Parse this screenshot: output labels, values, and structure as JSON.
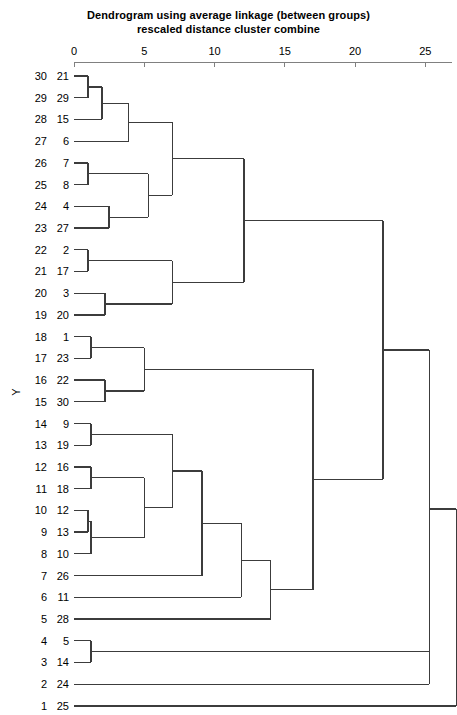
{
  "chart_data": {
    "type": "dendrogram",
    "title": "Dendrogram using average linkage (between groups)",
    "subtitle": "rescaled distance cluster combine",
    "xlabel": "",
    "ylabel": "Y",
    "xlim": [
      0,
      26.5
    ],
    "xticks": [
      0,
      5,
      10,
      15,
      20,
      25
    ],
    "xticklabels": [
      "0",
      "5",
      "10",
      "15",
      "20",
      "25"
    ],
    "grid": false,
    "legend": null,
    "axis_geometry": {
      "x_at_0": 74,
      "px_per_unit": 14.05,
      "first_leaf_y": 76,
      "leaf_spacing": 21.72
    },
    "leaf_num_labels": [
      "30",
      "29",
      "28",
      "27",
      "26",
      "25",
      "24",
      "23",
      "22",
      "21",
      "20",
      "19",
      "18",
      "17",
      "16",
      "15",
      "14",
      "13",
      "12",
      "11",
      "10",
      "9",
      "8",
      "7",
      "6",
      "5",
      "4",
      "3",
      "2",
      "1"
    ],
    "leaf_case_labels": [
      "21",
      "29",
      "15",
      "6",
      "7",
      "8",
      "4",
      "27",
      "2",
      "17",
      "3",
      "20",
      "1",
      "23",
      "22",
      "30",
      "9",
      "19",
      "16",
      "18",
      "12",
      "13",
      "10",
      "26",
      "11",
      "28",
      "5",
      "14",
      "24",
      "25"
    ],
    "merges": [
      {
        "id": "m1",
        "left": "leaf:21",
        "right": "leaf:29",
        "distance": 1.0
      },
      {
        "id": "m2",
        "left": "m1",
        "right": "leaf:15",
        "distance": 2.0
      },
      {
        "id": "m3",
        "left": "leaf:7",
        "right": "leaf:8",
        "distance": 1.0
      },
      {
        "id": "m4",
        "left": "m2",
        "right": "leaf:6",
        "distance": 3.9
      },
      {
        "id": "m5",
        "left": "leaf:4",
        "right": "leaf:27",
        "distance": 2.5
      },
      {
        "id": "m6",
        "left": "m3",
        "right": "m5",
        "distance": 5.3
      },
      {
        "id": "m7",
        "left": "m4",
        "right": "m6",
        "distance": 7.0
      },
      {
        "id": "m8",
        "left": "leaf:2",
        "right": "leaf:17",
        "distance": 1.0
      },
      {
        "id": "m9",
        "left": "leaf:3",
        "right": "leaf:20",
        "distance": 2.2
      },
      {
        "id": "m10",
        "left": "m8",
        "right": "m9",
        "distance": 7.0
      },
      {
        "id": "m11",
        "left": "m7",
        "right": "m10",
        "distance": 12.1
      },
      {
        "id": "m12",
        "left": "leaf:1",
        "right": "leaf:23",
        "distance": 1.2
      },
      {
        "id": "m13",
        "left": "leaf:22",
        "right": "leaf:30",
        "distance": 2.2
      },
      {
        "id": "m14",
        "left": "m12",
        "right": "m13",
        "distance": 5.0
      },
      {
        "id": "m15",
        "left": "leaf:9",
        "right": "leaf:19",
        "distance": 1.2
      },
      {
        "id": "m16",
        "left": "leaf:16",
        "right": "leaf:18",
        "distance": 1.2
      },
      {
        "id": "m17",
        "left": "leaf:12",
        "right": "leaf:13",
        "distance": 1.0
      },
      {
        "id": "m18",
        "left": "m17",
        "right": "leaf:10",
        "distance": 1.2
      },
      {
        "id": "m19",
        "left": "m16",
        "right": "m18",
        "distance": 5.0
      },
      {
        "id": "m20",
        "left": "m15",
        "right": "m19",
        "distance": 7.0
      },
      {
        "id": "m21",
        "left": "m20",
        "right": "leaf:26",
        "distance": 9.1
      },
      {
        "id": "m22",
        "left": "m21",
        "right": "leaf:11",
        "distance": 11.9
      },
      {
        "id": "m23",
        "left": "m22",
        "right": "leaf:28",
        "distance": 14.0
      },
      {
        "id": "m24",
        "left": "m14",
        "right": "m23",
        "distance": 17.0
      },
      {
        "id": "m25",
        "left": "m11",
        "right": "m24",
        "distance": 22.0
      },
      {
        "id": "m26",
        "left": "leaf:5",
        "right": "leaf:14",
        "distance": 1.2
      },
      {
        "id": "m27",
        "left": "m26",
        "right": "leaf:24",
        "distance": 25.3
      },
      {
        "id": "m28",
        "left": "m25",
        "right": "m27",
        "distance": 25.3
      },
      {
        "id": "m29",
        "left": "m28",
        "right": "leaf:25",
        "distance": 27.2
      }
    ]
  },
  "colors": {
    "line": "#3c3c3c",
    "axis": "#808080",
    "text": "#000000",
    "background": "#ffffff"
  }
}
